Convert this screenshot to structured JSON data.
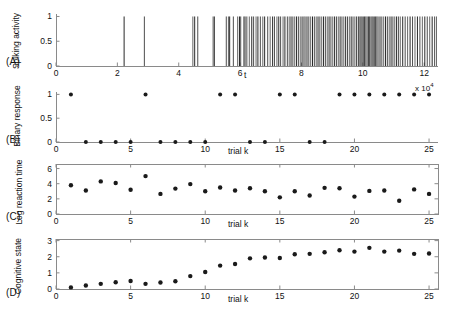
{
  "figure": {
    "background": "#ffffff",
    "axis_color": "#8a8a8a",
    "marker_color": "#1a1a1a",
    "spike_color": "#2a2a2a"
  },
  "panels": [
    {
      "tag": "(A)",
      "ylabel": "Spiking activity",
      "xlabel": "t",
      "box": false,
      "chart_data": {
        "type": "line",
        "title": "",
        "xlabel": "t",
        "ylabel": "Spiking activity",
        "xlim": [
          0,
          12.45
        ],
        "ylim": [
          0,
          1.05
        ],
        "xticks": [
          0,
          2,
          4,
          6,
          8,
          10,
          12
        ],
        "xticklabels": [
          "0",
          "2",
          "4",
          "6",
          "8",
          "10",
          "12"
        ],
        "yticks": [
          0,
          0.5,
          1
        ],
        "yticklabels": [
          "0",
          "0.5",
          "1"
        ],
        "grid": false,
        "legend": "none",
        "series": [
          {
            "name": "spike times",
            "values": [
              2.22,
              2.88,
              4.46,
              4.52,
              4.62,
              5.12,
              5.16,
              5.55,
              5.62,
              5.66,
              5.78,
              5.92,
              5.98,
              6.02,
              6.12,
              6.16,
              6.22,
              6.3,
              6.38,
              6.44,
              6.52,
              6.58,
              6.66,
              6.74,
              6.8,
              6.9,
              6.98,
              7.06,
              7.12,
              7.2,
              7.26,
              7.32,
              7.4,
              7.46,
              7.54,
              7.6,
              7.66,
              7.72,
              7.78,
              7.84,
              7.9,
              7.96,
              8.02,
              8.08,
              8.12,
              8.18,
              8.24,
              8.3,
              8.36,
              8.42,
              8.48,
              8.54,
              8.6,
              8.66,
              8.72,
              8.78,
              8.84,
              8.9,
              8.96,
              9.02,
              9.08,
              9.14,
              9.2,
              9.26,
              9.32,
              9.38,
              9.44,
              9.5,
              9.56,
              9.62,
              9.68,
              9.74,
              9.8,
              9.86,
              9.9,
              9.94,
              9.98,
              10.02,
              10.06,
              10.1,
              10.14,
              10.18,
              10.22,
              10.26,
              10.3,
              10.34,
              10.38,
              10.42,
              10.46,
              10.5,
              10.56,
              10.62,
              10.68,
              10.74,
              10.8,
              10.86,
              10.92,
              10.98,
              11.04,
              11.1,
              11.16,
              11.22,
              11.3,
              11.38,
              11.46,
              11.54,
              11.62,
              11.7,
              11.78,
              11.86,
              11.94,
              12.02,
              12.1,
              12.18,
              12.26,
              12.34,
              12.4
            ],
            "amplitude": 1
          }
        ]
      }
    },
    {
      "tag": "(B)",
      "ylabel": "Binary response",
      "xlabel": "trial k",
      "box": false,
      "annotation": "x 10",
      "annotation_exp": "4",
      "chart_data": {
        "type": "scatter",
        "title": "",
        "xlabel": "trial k",
        "ylabel": "Binary response",
        "xlim": [
          0,
          25.6
        ],
        "ylim": [
          0,
          1.05
        ],
        "xticks": [
          0,
          5,
          10,
          15,
          20,
          25
        ],
        "xticklabels": [
          "0",
          "5",
          "10",
          "15",
          "20",
          "25"
        ],
        "yticks": [
          0,
          0.5,
          1
        ],
        "yticklabels": [
          "0",
          "0.5",
          "1"
        ],
        "grid": false,
        "legend": "none",
        "x": [
          1,
          2,
          3,
          4,
          5,
          6,
          7,
          8,
          9,
          10,
          11,
          12,
          13,
          14,
          15,
          16,
          17,
          18,
          19,
          20,
          21,
          22,
          23,
          24,
          25
        ],
        "values": [
          1,
          0,
          0,
          0,
          0,
          1,
          0,
          0,
          0,
          0,
          1,
          1,
          0,
          0,
          1,
          1,
          0,
          0,
          1,
          1,
          1,
          1,
          1,
          1,
          1
        ]
      }
    },
    {
      "tag": "(C)",
      "ylabel": "Log reaction time",
      "xlabel": "trial k",
      "box": true,
      "chart_data": {
        "type": "scatter",
        "title": "",
        "xlabel": "trial k",
        "ylabel": "Log reaction time",
        "xlim": [
          0,
          25.6
        ],
        "ylim": [
          0,
          6.6
        ],
        "xticks": [
          0,
          5,
          10,
          15,
          20,
          25
        ],
        "xticklabels": [
          "0",
          "5",
          "10",
          "15",
          "20",
          "25"
        ],
        "yticks": [
          0,
          2,
          4,
          6
        ],
        "yticklabels": [
          "0",
          "2",
          "4",
          "6"
        ],
        "grid": false,
        "legend": "none",
        "x": [
          1,
          2,
          3,
          4,
          5,
          6,
          7,
          8,
          9,
          10,
          11,
          12,
          13,
          14,
          15,
          16,
          17,
          18,
          19,
          20,
          21,
          22,
          23,
          24,
          25
        ],
        "values": [
          3.8,
          3.1,
          4.3,
          4.1,
          3.2,
          5.0,
          2.65,
          3.35,
          3.95,
          3.0,
          3.5,
          3.1,
          3.4,
          3.0,
          2.2,
          3.0,
          2.45,
          3.45,
          3.4,
          2.3,
          3.05,
          3.1,
          1.75,
          3.25,
          2.65
        ]
      }
    },
    {
      "tag": "(D)",
      "ylabel": "Cognitive state",
      "xlabel": "trial k",
      "box": true,
      "chart_data": {
        "type": "scatter",
        "title": "",
        "xlabel": "trial k",
        "ylabel": "Cognitive state",
        "xlim": [
          0,
          25.6
        ],
        "ylim": [
          0,
          3.1
        ],
        "xticks": [
          0,
          5,
          10,
          15,
          20,
          25
        ],
        "xticklabels": [
          "0",
          "5",
          "10",
          "15",
          "20",
          "25"
        ],
        "yticks": [
          0,
          1,
          2,
          3
        ],
        "yticklabels": [
          "0",
          "1",
          "2",
          "3"
        ],
        "grid": false,
        "legend": "none",
        "x": [
          1,
          2,
          3,
          4,
          5,
          6,
          7,
          8,
          9,
          10,
          11,
          12,
          13,
          14,
          15,
          16,
          17,
          18,
          19,
          20,
          21,
          22,
          23,
          24,
          25
        ],
        "values": [
          0.1,
          0.22,
          0.32,
          0.42,
          0.5,
          0.32,
          0.4,
          0.48,
          0.8,
          1.05,
          1.45,
          1.55,
          1.9,
          1.95,
          1.92,
          2.15,
          2.18,
          2.28,
          2.4,
          2.32,
          2.55,
          2.32,
          2.38,
          2.18,
          2.2
        ]
      }
    }
  ]
}
